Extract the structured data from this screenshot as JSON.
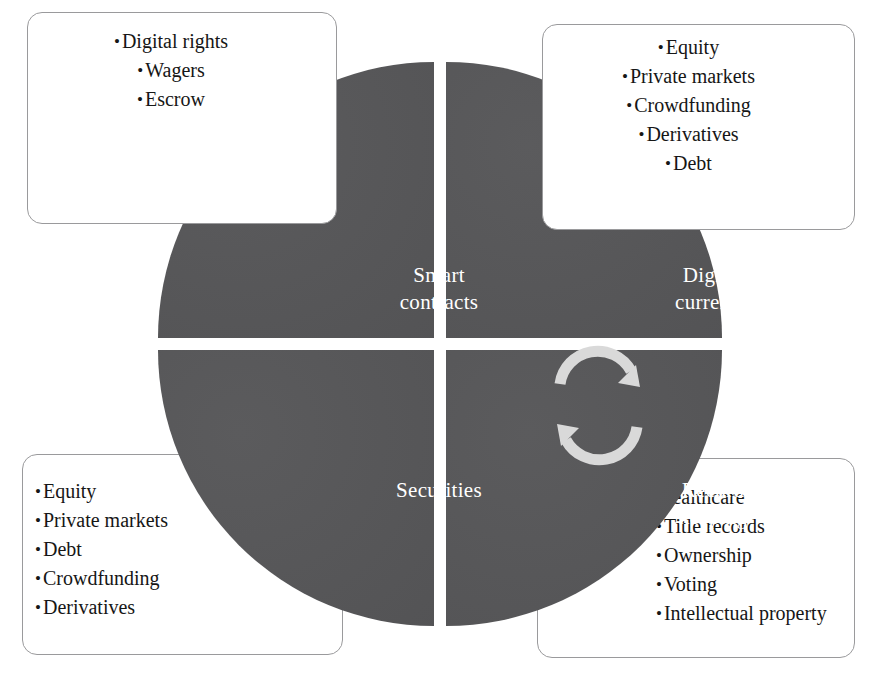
{
  "diagram": {
    "colors": {
      "quadrant_fill": "#555557",
      "quadrant_label": "#ffffff",
      "box_border": "#9a9a9c",
      "box_fill": "#ffffff",
      "arrow": "#d9d9d9",
      "text": "#161616"
    },
    "center_icon": "cycle-arrows-icon",
    "quadrants": [
      {
        "id": "smart-contracts",
        "position": "top-left",
        "label": "Smart\ncontracts",
        "callout": {
          "align": "center",
          "items": [
            {
              "bullet": "•",
              "text": "Digital rights"
            },
            {
              "bullet": "•",
              "text": "Wagers"
            },
            {
              "bullet": "•",
              "text": "Escrow"
            }
          ]
        }
      },
      {
        "id": "digital-currency",
        "position": "top-right",
        "label": "Digital\ncurrency",
        "callout": {
          "align": "center",
          "items": [
            {
              "bullet": "•",
              "text": "Equity"
            },
            {
              "bullet": "•",
              "text": "Private markets"
            },
            {
              "bullet": "•",
              "text": "Crowdfunding"
            },
            {
              "bullet": "•",
              "text": "Derivatives"
            },
            {
              "bullet": "•",
              "text": "Debt"
            }
          ]
        }
      },
      {
        "id": "securities",
        "position": "bottom-left",
        "label": "Securities",
        "callout": {
          "align": "left",
          "items": [
            {
              "bullet": "•",
              "text": "Equity"
            },
            {
              "bullet": "•",
              "text": "Private markets"
            },
            {
              "bullet": "•",
              "text": "Debt"
            },
            {
              "bullet": "•",
              "text": "Crowdfunding"
            },
            {
              "bullet": "•",
              "text": "Derivatives"
            }
          ]
        }
      },
      {
        "id": "record-keeping",
        "position": "bottom-right",
        "label": "Record\nkeeping",
        "callout": {
          "align": "left",
          "items": [
            {
              "bullet": "",
              "text": "Healthcare"
            },
            {
              "bullet": "•",
              "text": "Title records"
            },
            {
              "bullet": "•",
              "text": "Ownership"
            },
            {
              "bullet": "•",
              "text": "Voting"
            },
            {
              "bullet": "•",
              "text": "Intellectual property"
            }
          ]
        }
      }
    ]
  }
}
